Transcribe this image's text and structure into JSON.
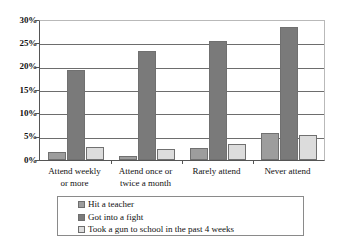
{
  "chart_data": {
    "type": "bar",
    "title": "",
    "xlabel": "",
    "ylabel": "",
    "ylim": [
      0,
      30
    ],
    "ytick_labels": [
      "0%",
      "5%",
      "10%",
      "15%",
      "20%",
      "25%",
      "30%"
    ],
    "ytick_values": [
      0,
      5,
      10,
      15,
      20,
      25,
      30
    ],
    "grid": "horizontal",
    "legend_position": "bottom",
    "categories": [
      "Attend weekly or more",
      "Attend once or twice a month",
      "Rarely attend",
      "Never attend"
    ],
    "category_lines": [
      [
        "Attend weekly",
        "or more"
      ],
      [
        "Attend once or",
        "twice a month"
      ],
      [
        "Rarely attend"
      ],
      [
        "Never attend"
      ]
    ],
    "series": [
      {
        "name": "Hit a teacher",
        "color": "#9d9d9d",
        "values": [
          1.7,
          0.8,
          2.5,
          5.8
        ]
      },
      {
        "name": "Got into a fight",
        "color": "#7a7a7a",
        "values": [
          19.2,
          23.4,
          25.5,
          28.5
        ]
      },
      {
        "name": "Took a gun to school in the past 4 weeks",
        "color": "#dcdcdc",
        "values": [
          2.8,
          2.3,
          3.5,
          5.3
        ]
      }
    ]
  },
  "legend": {
    "items": [
      {
        "label": "Hit a teacher",
        "swatch": "#9d9d9d"
      },
      {
        "label": "Got into a fight",
        "swatch": "#7a7a7a"
      },
      {
        "label": "Took a gun to school in the past 4 weeks",
        "swatch": "#dcdcdc"
      }
    ]
  }
}
